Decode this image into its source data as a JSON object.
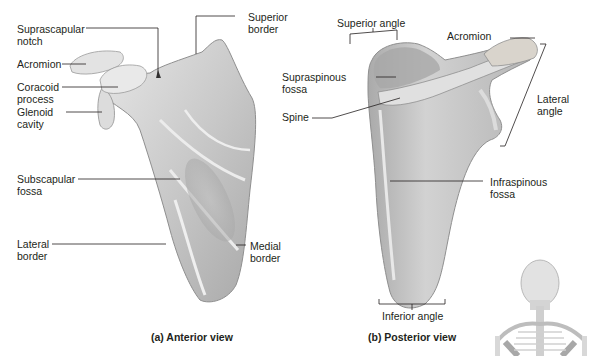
{
  "figure": {
    "panels": [
      {
        "id": "a",
        "caption": "(a) Anterior view",
        "labels": {
          "suprascapular_notch": "Suprascapular\nnotch",
          "acromion": "Acromion",
          "coracoid_process": "Coracoid\nprocess",
          "glenoid_cavity": "Glenoid\ncavity",
          "superior_border": "Superior\nborder",
          "subscapular_fossa": "Subscapular\nfossa",
          "lateral_border": "Lateral\nborder",
          "medial_border": "Medial\nborder"
        }
      },
      {
        "id": "b",
        "caption": "(b) Posterior view",
        "labels": {
          "superior_angle": "Superior angle",
          "acromion": "Acromion",
          "supraspinous_fossa": "Supraspinous\nfossa",
          "spine": "Spine",
          "lateral_angle": "Lateral\nangle",
          "infraspinous_fossa": "Infraspinous\nfossa",
          "inferior_angle": "Inferior angle"
        }
      }
    ],
    "inset": "posterior-skeleton-orientation",
    "colors": {
      "bone_light": "#e4e4e4",
      "bone_mid": "#bdbdbd",
      "bone_dark": "#8e8e8e",
      "leader_line": "#231f20",
      "background": "#ffffff"
    }
  }
}
